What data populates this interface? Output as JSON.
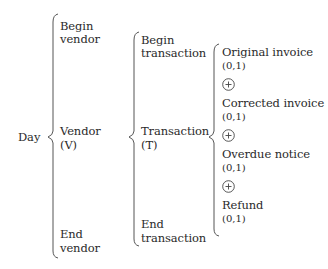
{
  "diagram": {
    "type": "Warnier-Orr diagram",
    "root": {
      "label": "Day"
    },
    "level1": {
      "begin": "Begin\nvendor",
      "begin_lines": [
        "Begin",
        "vendor"
      ],
      "main_lines": [
        "Vendor",
        "(V)"
      ],
      "end_lines": [
        "End",
        "vendor"
      ]
    },
    "level2": {
      "begin_lines": [
        "Begin",
        "transaction"
      ],
      "main_lines": [
        "Transaction",
        "(T)"
      ],
      "end_lines": [
        "End",
        "transaction"
      ]
    },
    "level3": {
      "items": [
        {
          "label": "Original invoice",
          "cardinality": "(0,1)"
        },
        {
          "label": "Corrected invoice",
          "cardinality": "(0,1)"
        },
        {
          "label": "Overdue notice",
          "cardinality": "(0,1)"
        },
        {
          "label": "Refund",
          "cardinality": "(0,1)"
        }
      ],
      "separator_icon": "exclusive-or-circle-plus"
    },
    "colors": {
      "ink": "#2a2a2a",
      "brace": "#555555",
      "background": "#ffffff"
    }
  }
}
